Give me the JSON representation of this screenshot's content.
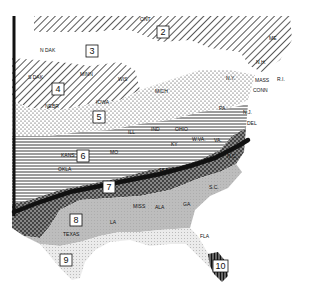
{
  "map": {
    "title": "",
    "zones": [
      {
        "id": "2",
        "label": "2",
        "x": 163,
        "y": 32
      },
      {
        "id": "3",
        "label": "3",
        "x": 92,
        "y": 51
      },
      {
        "id": "4",
        "label": "4",
        "x": 58,
        "y": 89
      },
      {
        "id": "5",
        "label": "5",
        "x": 99,
        "y": 117
      },
      {
        "id": "6",
        "label": "6",
        "x": 83,
        "y": 156
      },
      {
        "id": "7",
        "label": "7",
        "x": 109,
        "y": 187
      },
      {
        "id": "8",
        "label": "8",
        "x": 76,
        "y": 220
      },
      {
        "id": "9",
        "label": "9",
        "x": 66,
        "y": 260
      },
      {
        "id": "10",
        "label": "10",
        "x": 221,
        "y": 266
      }
    ],
    "state_labels": [
      {
        "text": "ONT",
        "x": 140,
        "y": 21
      },
      {
        "text": "N DAK",
        "x": 40,
        "y": 52
      },
      {
        "text": "S DAK",
        "x": 28,
        "y": 79
      },
      {
        "text": "MINN",
        "x": 80,
        "y": 76
      },
      {
        "text": "WIS",
        "x": 118,
        "y": 81
      },
      {
        "text": "NEBR",
        "x": 45,
        "y": 108
      },
      {
        "text": "IOWA",
        "x": 96,
        "y": 104
      },
      {
        "text": "MICH",
        "x": 155,
        "y": 93
      },
      {
        "text": "N.Y.",
        "x": 226,
        "y": 80
      },
      {
        "text": "ME",
        "x": 269,
        "y": 40
      },
      {
        "text": "N.H.",
        "x": 256,
        "y": 64
      },
      {
        "text": "MASS",
        "x": 255,
        "y": 82
      },
      {
        "text": "R.I.",
        "x": 277,
        "y": 81
      },
      {
        "text": "CONN",
        "x": 253,
        "y": 92
      },
      {
        "text": "PA",
        "x": 219,
        "y": 110
      },
      {
        "text": "N.J.",
        "x": 243,
        "y": 114
      },
      {
        "text": "DEL",
        "x": 247,
        "y": 125
      },
      {
        "text": "ILL",
        "x": 128,
        "y": 134
      },
      {
        "text": "IND",
        "x": 151,
        "y": 131
      },
      {
        "text": "OHIO",
        "x": 175,
        "y": 131
      },
      {
        "text": "W.VA.",
        "x": 192,
        "y": 141
      },
      {
        "text": "VA.",
        "x": 214,
        "y": 142
      },
      {
        "text": "KY",
        "x": 171,
        "y": 146
      },
      {
        "text": "MO",
        "x": 110,
        "y": 154
      },
      {
        "text": "KANS",
        "x": 61,
        "y": 157
      },
      {
        "text": "OKLA",
        "x": 58,
        "y": 171
      },
      {
        "text": "TENN",
        "x": 159,
        "y": 172
      },
      {
        "text": "N.C.",
        "x": 227,
        "y": 158
      },
      {
        "text": "S.C.",
        "x": 209,
        "y": 189
      },
      {
        "text": "MISS",
        "x": 133,
        "y": 208
      },
      {
        "text": "ALA",
        "x": 155,
        "y": 209
      },
      {
        "text": "GA",
        "x": 183,
        "y": 206
      },
      {
        "text": "LA",
        "x": 110,
        "y": 224
      },
      {
        "text": "TEXAS",
        "x": 63,
        "y": 236
      },
      {
        "text": "FLA",
        "x": 200,
        "y": 238
      }
    ]
  }
}
